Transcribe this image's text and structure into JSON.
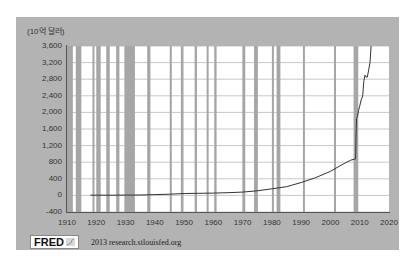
{
  "chart_data": {
    "type": "line",
    "title": "",
    "xlabel": "",
    "ylabel": "(10억 달러)",
    "unit_label": "(10억 달러)",
    "xlim": [
      1910,
      2020
    ],
    "ylim": [
      -400,
      3600
    ],
    "grid": true,
    "legend": null,
    "x_ticks": [
      "1910",
      "1920",
      "1930",
      "1940",
      "1950",
      "1960",
      "1970",
      "1980",
      "1990",
      "2000",
      "2010",
      "2020"
    ],
    "y_ticks": [
      "3,600",
      "3,200",
      "2,800",
      "2,400",
      "2,000",
      "1,600",
      "1,200",
      "800",
      "400",
      "0",
      "-400"
    ],
    "recession_bars": [
      [
        1910.0,
        1912.0
      ],
      [
        1913.0,
        1914.9
      ],
      [
        1918.7,
        1919.2
      ],
      [
        1920.0,
        1921.5
      ],
      [
        1923.4,
        1924.6
      ],
      [
        1926.8,
        1927.9
      ],
      [
        1929.6,
        1933.2
      ],
      [
        1937.4,
        1938.5
      ],
      [
        1945.1,
        1945.8
      ],
      [
        1948.9,
        1949.8
      ],
      [
        1953.6,
        1954.4
      ],
      [
        1957.7,
        1958.3
      ],
      [
        1960.3,
        1961.1
      ],
      [
        1969.9,
        1970.9
      ],
      [
        1973.9,
        1975.2
      ],
      [
        1980.0,
        1980.6
      ],
      [
        1981.6,
        1982.9
      ],
      [
        1990.6,
        1991.2
      ],
      [
        2001.2,
        2001.9
      ],
      [
        2007.9,
        2009.5
      ]
    ],
    "series": [
      {
        "name": "Federal Reserve assets (billions of dollars)",
        "x": [
          1918,
          1925,
          1935,
          1940,
          1945,
          1950,
          1955,
          1960,
          1965,
          1970,
          1975,
          1980,
          1985,
          1990,
          1995,
          2000,
          2003,
          2005,
          2007,
          2008.6,
          2008.75,
          2008.9,
          2009.2,
          2009.6,
          2010.0,
          2010.5,
          2011.0,
          2011.4,
          2011.8,
          2012.2,
          2012.6,
          2013.0,
          2013.5,
          2013.9
        ],
        "values": [
          5,
          5,
          10,
          20,
          30,
          45,
          50,
          55,
          65,
          80,
          110,
          160,
          210,
          310,
          430,
          580,
          700,
          780,
          850,
          880,
          1500,
          1850,
          1900,
          2050,
          2150,
          2300,
          2400,
          2750,
          2900,
          2850,
          2850,
          3000,
          3200,
          3600
        ]
      }
    ]
  },
  "footer": {
    "logo_text": "FRED",
    "source_text": "2013 research.stlouisfed.org"
  },
  "colors": {
    "panel": "#b3b3b3",
    "recession_bar": "#a6a6a6",
    "gridline": "#c8c8c8",
    "line": "#333333",
    "plot_bg": "#ffffff"
  }
}
